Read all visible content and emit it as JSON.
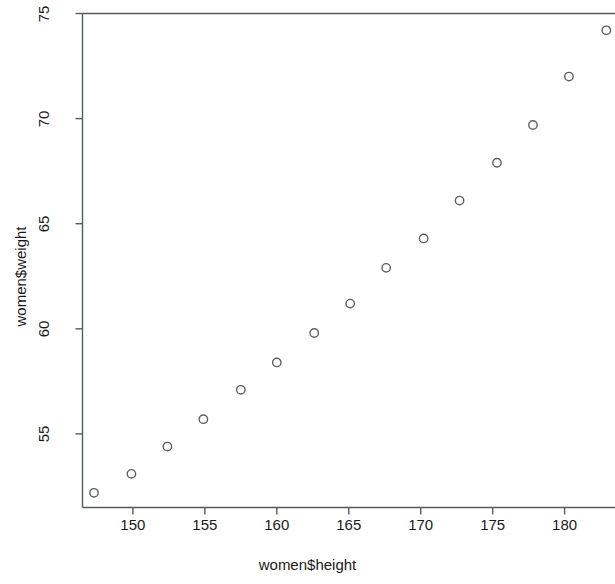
{
  "chart_data": {
    "type": "scatter",
    "title": "",
    "xlabel": "women$height",
    "ylabel": "women$weight",
    "xlim": [
      146.5,
      183.5
    ],
    "ylim": [
      51.5,
      75.0
    ],
    "xticks": [
      150,
      155,
      160,
      165,
      170,
      175,
      180
    ],
    "ytick_values": [
      55,
      60,
      65,
      70,
      75
    ],
    "grid": false,
    "legend": null,
    "marker": "open-circle",
    "marker_color": "#5c6066",
    "x": [
      147.3,
      149.9,
      152.4,
      154.9,
      157.5,
      160.0,
      162.6,
      165.1,
      167.6,
      170.2,
      172.7,
      175.3,
      177.8,
      180.3,
      182.9
    ],
    "y": [
      52.2,
      53.1,
      54.4,
      55.7,
      57.1,
      58.4,
      59.8,
      61.2,
      62.9,
      64.3,
      66.1,
      67.9,
      69.7,
      72.0,
      74.2
    ],
    "points": [
      {
        "x": 147.3,
        "y": 52.2
      },
      {
        "x": 149.9,
        "y": 53.1
      },
      {
        "x": 152.4,
        "y": 54.4
      },
      {
        "x": 154.9,
        "y": 55.7
      },
      {
        "x": 157.5,
        "y": 57.1
      },
      {
        "x": 160.0,
        "y": 58.4
      },
      {
        "x": 162.6,
        "y": 59.8
      },
      {
        "x": 165.1,
        "y": 61.2
      },
      {
        "x": 167.6,
        "y": 62.9
      },
      {
        "x": 170.2,
        "y": 64.3
      },
      {
        "x": 172.7,
        "y": 66.1
      },
      {
        "x": 175.3,
        "y": 67.9
      },
      {
        "x": 177.8,
        "y": 69.7
      },
      {
        "x": 180.3,
        "y": 72.0
      },
      {
        "x": 182.9,
        "y": 74.2
      }
    ],
    "xtick_labels": [
      "150",
      "155",
      "160",
      "165",
      "170",
      "175",
      "180"
    ],
    "ytick_labels": [
      "55",
      "60",
      "65",
      "70",
      "75"
    ]
  },
  "axes": {
    "x_title": "women$height",
    "y_title": "women$weight"
  }
}
